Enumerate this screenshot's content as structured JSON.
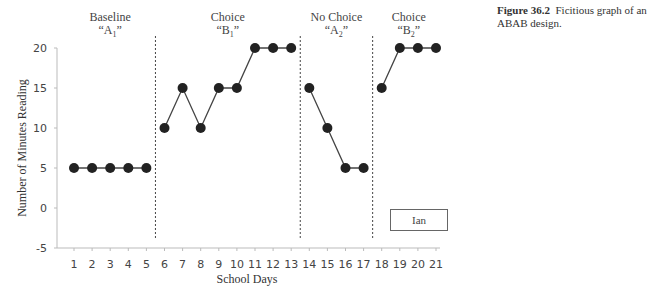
{
  "caption": {
    "figure_number": "Figure 36.2",
    "text": "Ficitious graph of an ABAB design."
  },
  "legend": {
    "label": "Ian"
  },
  "chart_data": {
    "type": "line",
    "title": "",
    "xlabel": "School Days",
    "ylabel": "Number of Minutes Reading",
    "xlim": [
      1,
      21
    ],
    "ylim": [
      -5,
      20
    ],
    "yticks": [
      -5,
      0,
      5,
      10,
      15,
      20
    ],
    "xticks": [
      1,
      2,
      3,
      4,
      5,
      6,
      7,
      8,
      9,
      10,
      11,
      12,
      13,
      14,
      15,
      16,
      17,
      18,
      19,
      20,
      21
    ],
    "grid": false,
    "legend_position": "lower right inside plot",
    "series": [
      {
        "name": "Ian",
        "color": "#222222",
        "marker": "circle"
      }
    ],
    "phases": [
      {
        "name": "Baseline",
        "code": "A",
        "subscript": "1",
        "days": [
          1,
          2,
          3,
          4,
          5
        ],
        "values": [
          5,
          5,
          5,
          5,
          5
        ]
      },
      {
        "name": "Choice",
        "code": "B",
        "subscript": "1",
        "days": [
          6,
          7,
          8,
          9,
          10,
          11,
          12,
          13
        ],
        "values": [
          10,
          15,
          10,
          15,
          15,
          20,
          20,
          20
        ]
      },
      {
        "name": "No Choice",
        "code": "A",
        "subscript": "2",
        "days": [
          14,
          15,
          16,
          17
        ],
        "values": [
          15,
          10,
          5,
          5
        ]
      },
      {
        "name": "Choice",
        "code": "B",
        "subscript": "2",
        "days": [
          18,
          19,
          20,
          21
        ],
        "values": [
          15,
          20,
          20,
          20
        ]
      }
    ],
    "phase_change_lines_at": [
      5.5,
      13.5,
      17.5
    ]
  }
}
